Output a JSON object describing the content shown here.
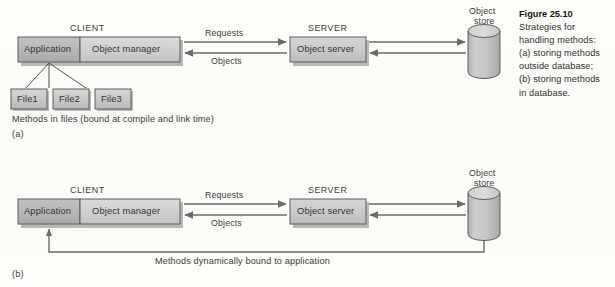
{
  "figure": {
    "number_label": "Figure 25.10",
    "caption_lines": [
      "Strategies for",
      "handling methods:",
      "(a) storing methods",
      "outside database;",
      "(b) storing methods",
      "in database."
    ]
  },
  "colors": {
    "page_background": "#fdfdfa",
    "box_fill_light": "#d0d0d0",
    "box_fill_dark": "#b4b4b4",
    "box_fill_mid": "#c2c2c2",
    "box_stroke": "#5a5a5a",
    "shadow": "#b9b9b9",
    "arrow": "#6b6b6b",
    "cylinder_fill": "#c6c6c6",
    "cylinder_top": "#d8d8d8",
    "text": "#3a3a3a"
  },
  "diagram_a": {
    "part_label": "(a)",
    "client_header": "CLIENT",
    "server_header": "SERVER",
    "client_application": "Application",
    "client_object_manager": "Object manager",
    "server_object_server": "Object server",
    "store_line1": "Object",
    "store_line2": "store",
    "arrow_requests": "Requests",
    "arrow_objects": "Objects",
    "files": [
      "File1",
      "File2",
      "File3"
    ],
    "footnote": "Methods in files (bound at compile and link time)"
  },
  "diagram_b": {
    "part_label": "(b)",
    "client_header": "CLIENT",
    "server_header": "SERVER",
    "client_application": "Application",
    "client_object_manager": "Object manager",
    "server_object_server": "Object server",
    "store_line1": "Object",
    "store_line2": "store",
    "arrow_requests": "Requests",
    "arrow_objects": "Objects",
    "footnote": "Methods dynamically bound to application"
  }
}
